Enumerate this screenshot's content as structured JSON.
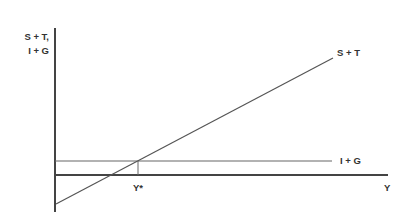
{
  "diagram": {
    "y_axis_label_line1": "S + T,",
    "y_axis_label_line2": "I + G",
    "x_axis_label": "Y",
    "lines": [
      {
        "name": "S + T",
        "label": "S + T"
      },
      {
        "name": "I + G",
        "label": "I + G"
      }
    ],
    "equilibrium_label": "Y*",
    "colors": {
      "axis": "#444444",
      "line": "#555555",
      "text": "#333333"
    }
  }
}
